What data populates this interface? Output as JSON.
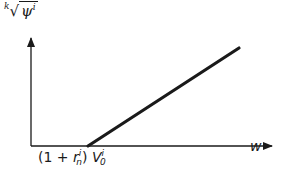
{
  "diagram": {
    "y_axis_label": {
      "root_index": "k",
      "symbol": "ψ",
      "superscript": "i"
    },
    "x_axis_label": "w",
    "x_intercept_label": {
      "prefix": "(1 + ",
      "r": "r",
      "r_sub": "n",
      "r_sup": "i",
      "close": ")",
      "v": "V",
      "v_sub": "0",
      "v_sup": "i"
    },
    "line": {
      "type": "kinked",
      "zero_until": "x_intercept",
      "then": "linear increasing"
    },
    "colors": {
      "ink": "#1a1a1a",
      "background": "#ffffff"
    }
  }
}
